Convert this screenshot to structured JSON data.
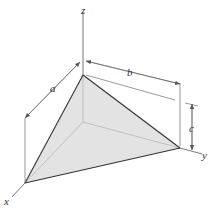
{
  "diagram": {
    "type": "3d-tetrahedron",
    "axes": {
      "x_label": "x",
      "y_label": "y",
      "z_label": "z"
    },
    "dimensions": {
      "a_label": "a",
      "b_label": "b",
      "c_label": "c"
    },
    "colors": {
      "face_fill": "#e3e3e3",
      "edge": "#333333",
      "axis": "#555555",
      "dimension_line": "#555555",
      "background": "#ffffff"
    }
  }
}
